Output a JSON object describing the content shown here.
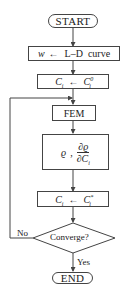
{
  "flowchart": {
    "start": {
      "label": "START"
    },
    "step1": {
      "var": "w",
      "arrow": "←",
      "text": "L–D  curve"
    },
    "step2": {
      "lhs": "C",
      "lhs_sub": "i",
      "arrow": "←",
      "rhs": "C",
      "rhs_sub": "i",
      "rhs_sup": "0"
    },
    "step3": {
      "label": "FEM"
    },
    "step4": {
      "symbol": "ϱ",
      "sep": ",",
      "num": "∂ϱ",
      "den": "∂C",
      "den_sub": "i"
    },
    "step5": {
      "lhs": "C",
      "lhs_sub": "i",
      "arrow": "←",
      "rhs": "C",
      "rhs_sub": "i",
      "rhs_sup": "*"
    },
    "decision": {
      "label": "Converge?"
    },
    "branch_no": {
      "label": "No"
    },
    "branch_yes": {
      "label": "Yes"
    },
    "end": {
      "label": "END"
    }
  },
  "colors": {
    "line": "#444444",
    "text": "#222222",
    "background": "#ffffff"
  }
}
